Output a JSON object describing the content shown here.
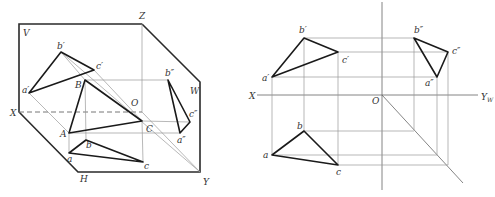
{
  "left_diagram": {
    "title": "three-plane projection (pictorial)",
    "labels": {
      "V": "V",
      "Z": "Z",
      "W": "W",
      "X": "X",
      "O": "O",
      "H": "H",
      "Y": "Y",
      "a_v": "a′",
      "b_v": "b′",
      "c_v": "c′",
      "A": "A",
      "B": "B",
      "C": "C",
      "a_w": "a″",
      "b_w": "b″",
      "c_w": "c″",
      "a_h": "a",
      "b_h": "b",
      "c_h": "c"
    }
  },
  "right_diagram": {
    "title": "three-view orthographic projection",
    "labels": {
      "X": "X",
      "O": "O",
      "Yw": "Y",
      "Yw_sub": "W",
      "a_v": "a′",
      "b_v": "b′",
      "c_v": "c′",
      "a_w": "a″",
      "b_w": "b″",
      "c_w": "c″",
      "a_h": "a",
      "b_h": "b",
      "c_h": "c"
    }
  },
  "colors": {
    "stroke": "#1a1a1a",
    "thin": "#9a9a9a",
    "label": "#333333"
  }
}
